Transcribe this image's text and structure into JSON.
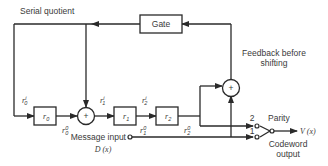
{
  "labels": {
    "serial_quotient": "Serial quotient",
    "gate": "Gate",
    "feedback_line1": "Feedback before",
    "feedback_line2": "shifting",
    "message_input": "Message input",
    "message_symbol": "D (x)",
    "parity": "Parity",
    "codeword_line1": "Codeword",
    "codeword_line2": "output",
    "output_symbol": "V (x)",
    "switch_pos_2": "2",
    "switch_pos_1": "1",
    "xor_symbol": "+"
  },
  "registers": [
    {
      "name": "r",
      "sub": "0",
      "in_sub": "0",
      "in_sup": "i",
      "out_sub": "0",
      "out_sup": "0"
    },
    {
      "name": "r",
      "sub": "1",
      "in_sub": "1",
      "in_sup": "i",
      "out_sub": "1",
      "out_sup": "0"
    },
    {
      "name": "r",
      "sub": "2",
      "in_sub": "2",
      "in_sup": "i",
      "out_sub": "2",
      "out_sup": "0"
    }
  ],
  "colors": {
    "line": "#2a2a2a",
    "text": "#3a3a3a",
    "background": "#ffffff"
  }
}
